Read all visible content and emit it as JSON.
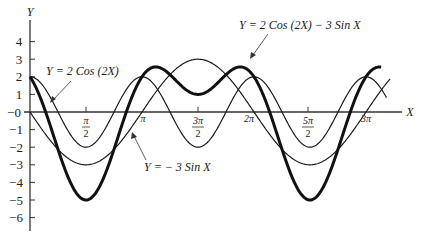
{
  "chart_data": {
    "type": "line",
    "title": "",
    "xlabel": "X",
    "ylabel": "Y",
    "xlim": [
      0,
      9.9
    ],
    "ylim": [
      -6.5,
      4.7
    ],
    "grid": false,
    "legend_position": "annotations",
    "x_ticks": [
      {
        "value": 1.5708,
        "label_num": "π",
        "label_den": "2"
      },
      {
        "value": 3.1416,
        "label": "π"
      },
      {
        "value": 4.7124,
        "label_num": "3π",
        "label_den": "2"
      },
      {
        "value": 6.2832,
        "label": "2π"
      },
      {
        "value": 7.854,
        "label_num": "5π",
        "label_den": "2"
      },
      {
        "value": 9.4248,
        "label": "3π"
      }
    ],
    "y_ticks": [
      {
        "value": 4,
        "label": "4"
      },
      {
        "value": 3,
        "label": "3"
      },
      {
        "value": 2,
        "label": "2"
      },
      {
        "value": 1,
        "label": "1"
      },
      {
        "value": 0,
        "label": "−0"
      },
      {
        "value": -1,
        "label": "−1"
      },
      {
        "value": -2,
        "label": "−2"
      },
      {
        "value": -3,
        "label": "−3"
      },
      {
        "value": -4,
        "label": "−4"
      },
      {
        "value": -5,
        "label": "−5"
      },
      {
        "value": -6,
        "label": "−6"
      }
    ],
    "series": [
      {
        "name": "Y = 2 Cos (2X)",
        "function": "2*cos(2*x)",
        "stroke": "thin",
        "x": [
          0,
          0.785,
          1.571,
          2.356,
          3.142,
          3.927,
          4.712,
          5.498,
          6.283,
          7.069,
          7.854,
          8.639,
          9.425
        ],
        "values": [
          2,
          0,
          -2,
          0,
          2,
          0,
          -2,
          0,
          2,
          0,
          -2,
          0,
          2
        ]
      },
      {
        "name": "Y = − 3 Sin X",
        "function": "-3*sin(x)",
        "stroke": "thin",
        "x": [
          0,
          1.571,
          3.142,
          4.712,
          6.283,
          7.854,
          9.425
        ],
        "values": [
          0,
          -3,
          0,
          3,
          0,
          -3,
          0
        ]
      },
      {
        "name": "Y = 2 Cos (2X) − 3 Sin X",
        "function": "2*cos(2*x)-3*sin(x)",
        "stroke": "thick",
        "x": [
          0,
          1.571,
          3.142,
          3.99,
          4.712,
          5.435,
          6.283,
          7.854,
          9.425
        ],
        "values": [
          2,
          -5,
          2,
          3.4,
          1,
          3.4,
          2,
          -5,
          2
        ]
      }
    ],
    "annotations": [
      {
        "text": "Y = 2 Cos (2X)",
        "target_series": 0
      },
      {
        "text": "Y = 2 Cos (2X) − 3 Sin X",
        "target_series": 2
      },
      {
        "text": "Y = − 3 Sin X",
        "target_series": 1
      }
    ]
  },
  "labels": {
    "y_axis": "Y",
    "x_axis": "X",
    "ann_cos": "Y = 2 Cos (2X)",
    "ann_sum": "Y = 2 Cos (2X) − 3 Sin X",
    "ann_sin": "Y = − 3 Sin X",
    "tick_pi": "π",
    "tick_2pi": "2π",
    "tick_3pi": "3π",
    "tick_pi_num": "π",
    "tick_3pi_num": "3π",
    "tick_5pi_num": "5π",
    "tick_den": "2",
    "y4": "4",
    "y3": "3",
    "y2": "2",
    "y1": "1",
    "y0": "−0",
    "ym1": "−1",
    "ym2": "−2",
    "ym3": "−3",
    "ym4": "−4",
    "ym5": "−5",
    "ym6": "−6"
  }
}
